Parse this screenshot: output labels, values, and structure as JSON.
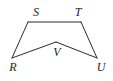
{
  "figure": {
    "kind": "geometry-diagram",
    "shape_name": "concave pentagon RSTUV",
    "background_color": "#ffffff",
    "stroke_color": "#2b2b2b",
    "label_color": "#1d1d1d",
    "stroke_width": 1,
    "canvas": {
      "width": 113,
      "height": 81
    },
    "vertices": [
      {
        "id": "R",
        "label": "R",
        "x": 12,
        "y": 58,
        "label_x": 13,
        "label_y": 67
      },
      {
        "id": "S",
        "label": "S",
        "x": 28,
        "y": 22,
        "label_x": 36,
        "label_y": 12
      },
      {
        "id": "T",
        "label": "T",
        "x": 81,
        "y": 22,
        "label_x": 78,
        "label_y": 12
      },
      {
        "id": "U",
        "label": "U",
        "x": 97,
        "y": 58,
        "label_x": 101,
        "label_y": 67
      },
      {
        "id": "V",
        "label": "V",
        "x": 56,
        "y": 42,
        "label_x": 57,
        "label_y": 52
      }
    ],
    "edges": [
      {
        "id": "RS",
        "from": "R",
        "to": "S",
        "path": "M 12 58 L 28 22"
      },
      {
        "id": "ST",
        "from": "S",
        "to": "T",
        "path": "M 28 22 L 81 22"
      },
      {
        "id": "TU",
        "from": "T",
        "to": "U",
        "path": "M 81 22 L 97 58"
      },
      {
        "id": "UV",
        "from": "U",
        "to": "V",
        "path": "M 97 58 L 56 42"
      },
      {
        "id": "VR",
        "from": "V",
        "to": "R",
        "path": "M 56 42 L 12 58"
      }
    ],
    "outline_path": "M 12 58 L 28 22 L 81 22 L 97 58 L 56 42 Z"
  }
}
